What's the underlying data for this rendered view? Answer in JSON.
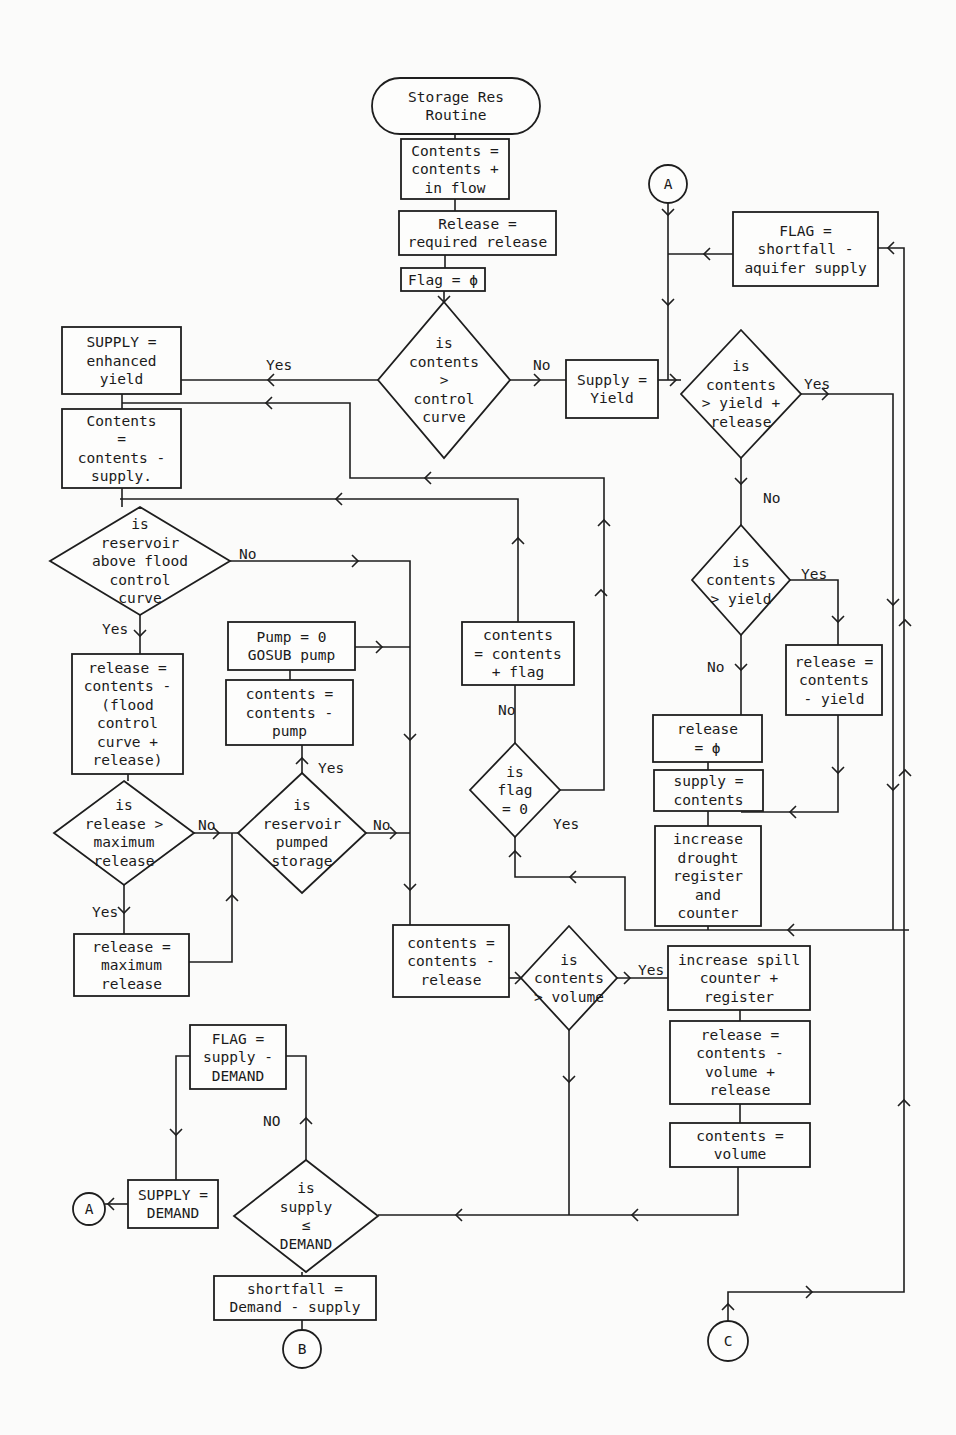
{
  "diagram": {
    "nodes": [
      {
        "id": "start",
        "type": "terminal",
        "x": 372,
        "y": 78,
        "w": 168,
        "h": 56,
        "lines": [
          "Storage Res",
          "Routine"
        ]
      },
      {
        "id": "n_inflow",
        "type": "process",
        "x": 401,
        "y": 139,
        "w": 108,
        "h": 60,
        "lines": [
          "Contents =",
          "contents +",
          " in flow"
        ]
      },
      {
        "id": "n_release_req",
        "type": "process",
        "x": 399,
        "y": 211,
        "w": 157,
        "h": 44,
        "lines": [
          "Release =",
          "required release"
        ]
      },
      {
        "id": "n_flag0",
        "type": "process",
        "x": 401,
        "y": 268,
        "w": 84,
        "h": 23,
        "lines": [
          "Flag = ϕ"
        ]
      },
      {
        "id": "d_control",
        "type": "decision",
        "cx": 444,
        "cy": 380,
        "hw": 66,
        "hh": 78,
        "lines": [
          "is",
          "contents",
          ">",
          "control",
          "curve"
        ]
      },
      {
        "id": "n_enhanced",
        "type": "process",
        "x": 62,
        "y": 327,
        "w": 119,
        "h": 67,
        "lines": [
          "SUPPLY =",
          "enhanced",
          "yield"
        ]
      },
      {
        "id": "n_contents_supply",
        "type": "process",
        "x": 62,
        "y": 409,
        "w": 119,
        "h": 79,
        "lines": [
          "Contents",
          "  =",
          "contents -",
          " supply."
        ]
      },
      {
        "id": "d_flood",
        "type": "decision",
        "cx": 140,
        "cy": 561,
        "hw": 90,
        "hh": 54,
        "lines": [
          "is",
          " reservoir",
          "above flood",
          " control",
          "  curve"
        ]
      },
      {
        "id": "n_release_flood",
        "type": "process",
        "x": 72,
        "y": 654,
        "w": 111,
        "h": 120,
        "lines": [
          "release =",
          "contents -",
          "(flood",
          "  control",
          "curve    +",
          "release)"
        ]
      },
      {
        "id": "d_maxrel",
        "type": "decision",
        "cx": 124,
        "cy": 833,
        "hw": 70,
        "hh": 52,
        "lines": [
          "is",
          "release >",
          "maximum",
          " release"
        ]
      },
      {
        "id": "n_maxrel",
        "type": "process",
        "x": 74,
        "y": 934,
        "w": 115,
        "h": 62,
        "lines": [
          "release =",
          "maximum",
          "release"
        ]
      },
      {
        "id": "d_pumped",
        "type": "decision",
        "cx": 302,
        "cy": 833,
        "hw": 64,
        "hh": 60,
        "lines": [
          "is",
          "reservoir",
          "pumped",
          "storage"
        ]
      },
      {
        "id": "n_contents_pump",
        "type": "process",
        "x": 226,
        "y": 680,
        "w": 127,
        "h": 65,
        "lines": [
          "contents =",
          "contents -",
          "pump"
        ]
      },
      {
        "id": "n_pump0",
        "type": "process",
        "x": 228,
        "y": 622,
        "w": 127,
        "h": 48,
        "lines": [
          "Pump = 0",
          "GOSUB pump"
        ]
      },
      {
        "id": "n_contents_release",
        "type": "process",
        "x": 393,
        "y": 925,
        "w": 116,
        "h": 72,
        "lines": [
          "contents =",
          "contents -",
          "release"
        ]
      },
      {
        "id": "d_volume",
        "type": "decision",
        "cx": 569,
        "cy": 978,
        "hw": 48,
        "hh": 52,
        "lines": [
          "is",
          "contents",
          "> volume"
        ]
      },
      {
        "id": "n_spill",
        "type": "process",
        "x": 668,
        "y": 946,
        "w": 142,
        "h": 64,
        "lines": [
          "increase spill",
          "counter +",
          "register"
        ]
      },
      {
        "id": "n_release_vol",
        "type": "process",
        "x": 670,
        "y": 1021,
        "w": 140,
        "h": 83,
        "lines": [
          "release =",
          "contents -",
          "volume +",
          "release"
        ]
      },
      {
        "id": "n_contents_vol",
        "type": "process",
        "x": 670,
        "y": 1123,
        "w": 140,
        "h": 44,
        "lines": [
          "contents =",
          "volume"
        ]
      },
      {
        "id": "d_flag",
        "type": "decision",
        "cx": 515,
        "cy": 790,
        "hw": 45,
        "hh": 47,
        "lines": [
          "is",
          "flag",
          "= 0"
        ]
      },
      {
        "id": "n_contents_flag",
        "type": "process",
        "x": 462,
        "y": 622,
        "w": 112,
        "h": 63,
        "lines": [
          "contents",
          "= contents",
          "+ flag"
        ]
      },
      {
        "id": "n_supply_yield",
        "type": "process",
        "x": 566,
        "y": 360,
        "w": 92,
        "h": 58,
        "lines": [
          "Supply =",
          "Yield"
        ]
      },
      {
        "id": "d_yr",
        "type": "decision",
        "cx": 741,
        "cy": 394,
        "hw": 60,
        "hh": 64,
        "lines": [
          "is",
          "contents",
          "> yield +",
          "release"
        ]
      },
      {
        "id": "d_yield",
        "type": "decision",
        "cx": 741,
        "cy": 580,
        "hw": 49,
        "hh": 55,
        "lines": [
          "is",
          "contents",
          "> yield"
        ]
      },
      {
        "id": "n_release_cy",
        "type": "process",
        "x": 786,
        "y": 645,
        "w": 96,
        "h": 70,
        "lines": [
          "release =",
          "contents",
          "  - yield"
        ]
      },
      {
        "id": "n_release_phi",
        "type": "process",
        "x": 653,
        "y": 715,
        "w": 109,
        "h": 47,
        "lines": [
          "release",
          "  = ϕ"
        ]
      },
      {
        "id": "n_supply_contents",
        "type": "process",
        "x": 654,
        "y": 770,
        "w": 109,
        "h": 41,
        "lines": [
          "supply =",
          "contents"
        ]
      },
      {
        "id": "n_drought",
        "type": "process",
        "x": 655,
        "y": 826,
        "w": 106,
        "h": 100,
        "lines": [
          "increase",
          "drought",
          "register",
          "and",
          "counter"
        ]
      },
      {
        "id": "n_flag_short",
        "type": "process",
        "x": 733,
        "y": 212,
        "w": 145,
        "h": 74,
        "lines": [
          "FLAG =",
          "shortfall -",
          "aquifer supply"
        ]
      },
      {
        "id": "n_flag_demand",
        "type": "process",
        "x": 190,
        "y": 1025,
        "w": 96,
        "h": 64,
        "lines": [
          "FLAG =",
          "supply -",
          "DEMAND"
        ]
      },
      {
        "id": "n_supply_demand",
        "type": "process",
        "x": 128,
        "y": 1180,
        "w": 90,
        "h": 48,
        "lines": [
          "SUPPLY =",
          "DEMAND"
        ]
      },
      {
        "id": "d_demand",
        "type": "decision",
        "cx": 306,
        "cy": 1216,
        "hw": 72,
        "hh": 56,
        "lines": [
          "is",
          "supply",
          "≤",
          "DEMAND"
        ]
      },
      {
        "id": "n_shortfall",
        "type": "process",
        "x": 214,
        "y": 1276,
        "w": 162,
        "h": 44,
        "lines": [
          "shortfall =",
          "Demand - supply"
        ]
      }
    ],
    "connectors": [
      {
        "id": "c_A_top",
        "label": "A",
        "cx": 668,
        "cy": 184,
        "r": 19
      },
      {
        "id": "c_A_bottom",
        "label": "A",
        "cx": 89,
        "cy": 1209,
        "r": 16
      },
      {
        "id": "c_B",
        "label": "B",
        "cx": 302,
        "cy": 1349,
        "r": 19
      },
      {
        "id": "c_C",
        "label": "C",
        "cx": 728,
        "cy": 1341,
        "r": 20
      }
    ],
    "edge_labels": [
      {
        "text": "Yes",
        "x": 266,
        "y": 370
      },
      {
        "text": "No",
        "x": 533,
        "y": 370
      },
      {
        "text": "Yes",
        "x": 804,
        "y": 389
      },
      {
        "text": "No",
        "x": 763,
        "y": 503
      },
      {
        "text": "Yes",
        "x": 801,
        "y": 579
      },
      {
        "text": "No",
        "x": 707,
        "y": 672
      },
      {
        "text": "No",
        "x": 239,
        "y": 559
      },
      {
        "text": "Yes",
        "x": 102,
        "y": 634
      },
      {
        "text": "No",
        "x": 198,
        "y": 830
      },
      {
        "text": "Yes",
        "x": 92,
        "y": 917
      },
      {
        "text": "Yes",
        "x": 318,
        "y": 773
      },
      {
        "text": "No",
        "x": 373,
        "y": 830
      },
      {
        "text": "No",
        "x": 498,
        "y": 715
      },
      {
        "text": "Yes",
        "x": 553,
        "y": 829
      },
      {
        "text": "Yes",
        "x": 638,
        "y": 975
      },
      {
        "text": "NO",
        "x": 263,
        "y": 1126
      }
    ],
    "paths": [
      "M455,134 L455,139",
      "M455,199 L455,211",
      "M445,255 L445,268",
      "M444,291 L444,302",
      "M378,380 L181,380",
      "M510,380 L566,380",
      "M658,380 L681,380",
      "M668,203 L668,380",
      "M733,254 L668,254",
      "M801,394 L893,394 L893,930",
      "M741,458 L741,525",
      "M790,580 L838,580 L838,645",
      "M838,715 L838,812 L741,812",
      "M741,635 L741,715",
      "M708,762 L708,770",
      "M708,811 L708,826",
      "M708,926 L708,930",
      "M909,930 L625,930 L625,877 L515,877 L515,837",
      "M515,743 L515,685",
      "M518,622 L518,499 L120,499",
      "M560,790 L604,790 L604,478 L350,478 L350,403 L122,403",
      "M122,394 L122,409",
      "M122,488 L122,507",
      "M230,561 L410,561 L410,925",
      "M140,615 L140,654",
      "M128,774 L128,781",
      "M194,833 L238,833",
      "M124,885 L124,934",
      "M189,962 L232,962 L232,833",
      "M366,833 L410,833",
      "M355,647 L410,647",
      "M302,773 L302,745",
      "M290,680 L290,670",
      "M509,978 L521,978",
      "M617,978 L668,978",
      "M740,1010 L740,1021",
      "M740,1104 L740,1123",
      "M738,1167 L738,1215 L378,1215",
      "M569,1030 L569,1215",
      "M306,1160 L306,1056 L286,1056",
      "M190,1056 L176,1056 L176,1180",
      "M128,1204 L105,1204",
      "M302,1272 L302,1276",
      "M302,1320 L302,1330",
      "M728,1321 L728,1292 L904,1292 L904,248 L878,248"
    ],
    "arrows": [
      {
        "x": 444,
        "y": 302,
        "dir": "down"
      },
      {
        "x": 268,
        "y": 380,
        "dir": "left"
      },
      {
        "x": 540,
        "y": 380,
        "dir": "right"
      },
      {
        "x": 668,
        "y": 215,
        "dir": "down"
      },
      {
        "x": 668,
        "y": 305,
        "dir": "down"
      },
      {
        "x": 676,
        "y": 380,
        "dir": "right"
      },
      {
        "x": 704,
        "y": 254,
        "dir": "left"
      },
      {
        "x": 828,
        "y": 394,
        "dir": "right"
      },
      {
        "x": 893,
        "y": 605,
        "dir": "down"
      },
      {
        "x": 893,
        "y": 790,
        "dir": "down"
      },
      {
        "x": 905,
        "y": 620,
        "dir": "up"
      },
      {
        "x": 905,
        "y": 770,
        "dir": "up"
      },
      {
        "x": 904,
        "y": 1100,
        "dir": "up"
      },
      {
        "x": 888,
        "y": 248,
        "dir": "left"
      },
      {
        "x": 741,
        "y": 484,
        "dir": "down"
      },
      {
        "x": 838,
        "y": 622,
        "dir": "down"
      },
      {
        "x": 838,
        "y": 773,
        "dir": "down"
      },
      {
        "x": 741,
        "y": 670,
        "dir": "down"
      },
      {
        "x": 790,
        "y": 812,
        "dir": "left"
      },
      {
        "x": 788,
        "y": 930,
        "dir": "left"
      },
      {
        "x": 570,
        "y": 877,
        "dir": "left"
      },
      {
        "x": 515,
        "y": 851,
        "dir": "up"
      },
      {
        "x": 518,
        "y": 538,
        "dir": "up"
      },
      {
        "x": 604,
        "y": 520,
        "dir": "up"
      },
      {
        "x": 601,
        "y": 590,
        "dir": "up"
      },
      {
        "x": 336,
        "y": 499,
        "dir": "left"
      },
      {
        "x": 425,
        "y": 478,
        "dir": "left"
      },
      {
        "x": 266,
        "y": 403,
        "dir": "left"
      },
      {
        "x": 358,
        "y": 561,
        "dir": "right"
      },
      {
        "x": 410,
        "y": 740,
        "dir": "down"
      },
      {
        "x": 410,
        "y": 890,
        "dir": "down"
      },
      {
        "x": 219,
        "y": 833,
        "dir": "right"
      },
      {
        "x": 232,
        "y": 895,
        "dir": "up"
      },
      {
        "x": 396,
        "y": 833,
        "dir": "right"
      },
      {
        "x": 382,
        "y": 647,
        "dir": "right"
      },
      {
        "x": 302,
        "y": 758,
        "dir": "up"
      },
      {
        "x": 124,
        "y": 913,
        "dir": "down"
      },
      {
        "x": 140,
        "y": 636,
        "dir": "down"
      },
      {
        "x": 521,
        "y": 978,
        "dir": "right"
      },
      {
        "x": 630,
        "y": 978,
        "dir": "right"
      },
      {
        "x": 569,
        "y": 1082,
        "dir": "down"
      },
      {
        "x": 632,
        "y": 1215,
        "dir": "left"
      },
      {
        "x": 456,
        "y": 1215,
        "dir": "left"
      },
      {
        "x": 306,
        "y": 1118,
        "dir": "up"
      },
      {
        "x": 176,
        "y": 1135,
        "dir": "down"
      },
      {
        "x": 108,
        "y": 1204,
        "dir": "left"
      },
      {
        "x": 728,
        "y": 1304,
        "dir": "up"
      },
      {
        "x": 812,
        "y": 1292,
        "dir": "right"
      }
    ]
  }
}
